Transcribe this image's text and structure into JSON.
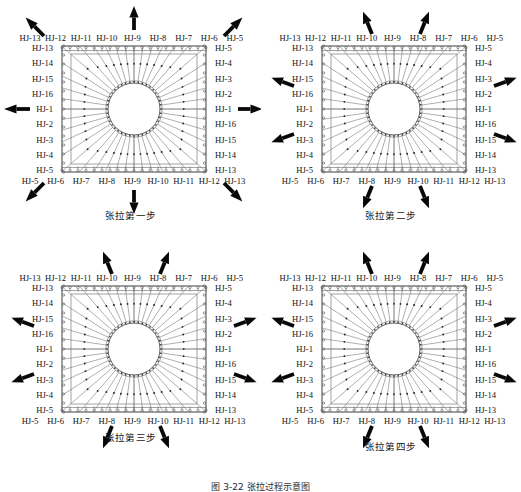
{
  "figure": {
    "caption": "图 3-22  张拉过程示意图",
    "panel_count": 4
  },
  "labels": {
    "top": [
      "HJ-13",
      "HJ-12",
      "HJ-11",
      "HJ-10",
      "HJ-9",
      "HJ-8",
      "HJ-7",
      "HJ-6",
      "HJ-5"
    ],
    "bottom": [
      "HJ-5",
      "HJ-6",
      "HJ-7",
      "HJ-8",
      "HJ-9",
      "HJ-10",
      "HJ-11",
      "HJ-12",
      "HJ-13"
    ],
    "left": [
      "HJ-13",
      "HJ-14",
      "HJ-15",
      "HJ-16",
      "HJ-1",
      "HJ-2",
      "HJ-3",
      "HJ-4",
      "HJ-5"
    ],
    "right": [
      "HJ-5",
      "HJ-4",
      "HJ-3",
      "HJ-2",
      "HJ-1",
      "HJ-16",
      "HJ-15",
      "HJ-14",
      "HJ-13"
    ]
  },
  "panels": [
    {
      "id": "step-1",
      "caption": "张拉第一步",
      "arrows": [
        "top-left",
        "top",
        "top-right",
        "left",
        "right",
        "bottom-left",
        "bottom",
        "bottom-right"
      ]
    },
    {
      "id": "step-2",
      "caption": "张拉第二步",
      "arrows": [
        "top-left-in",
        "top-right-in",
        "left-upper",
        "right-upper",
        "left-lower",
        "right-lower",
        "bottom-left-in",
        "bottom-right-in"
      ]
    },
    {
      "id": "step-3",
      "caption": "张拉第三步",
      "arrows": [
        "top-left-in",
        "top-right-in",
        "left-upper",
        "right-upper",
        "left-lower",
        "right-lower",
        "bottom-left-in",
        "bottom-right-in"
      ]
    },
    {
      "id": "step-4",
      "caption": "张拉第四步",
      "arrows": [
        "top-left-in",
        "top-right-in",
        "left-upper",
        "right-upper",
        "left-lower",
        "right-lower",
        "bottom-left-in",
        "bottom-right-in"
      ]
    }
  ],
  "colors": {
    "ink": "#111111",
    "frame": "#2b2b2b",
    "cable": "#6e6e6e",
    "arrow": "#080808",
    "background": "#ffffff"
  }
}
